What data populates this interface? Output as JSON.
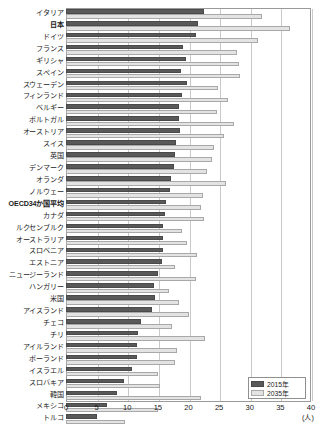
{
  "chart_data": {
    "type": "bar",
    "orientation": "horizontal",
    "title": "",
    "xlabel": "(人)",
    "ylabel": "",
    "xlim": [
      0,
      40
    ],
    "xticks": [
      0,
      5,
      10,
      15,
      20,
      25,
      30,
      35,
      40
    ],
    "xtick_labels": [
      "0",
      "5",
      "10",
      "15",
      "20",
      "25",
      "30",
      "35",
      "40"
    ],
    "grid": true,
    "legend_position": "bottom-right",
    "legend": [
      "2015年",
      "2035年"
    ],
    "categories": [
      "イタリア",
      "日本",
      "ドイツ",
      "フランス",
      "ギリシャ",
      "スペイン",
      "スウェーデン",
      "フィンランド",
      "ベルギー",
      "ポルトガル",
      "オーストリア",
      "スイス",
      "英国",
      "デンマーク",
      "オランダ",
      "ノルウェー",
      "OECD34か国平均",
      "カナダ",
      "ルクセンブルク",
      "オーストラリア",
      "スロベニア",
      "エストニア",
      "ニュージーランド",
      "ハンガリー",
      "米国",
      "アイスランド",
      "チェコ",
      "チリ",
      "アイルランド",
      "ポーランド",
      "イスラエル",
      "スロバキア",
      "韓国",
      "メキシコ",
      "トルコ"
    ],
    "bold_categories": [
      "日本",
      "OECD34か国平均"
    ],
    "series": [
      {
        "name": "2015年",
        "color": "#595959",
        "values": [
          22.6,
          21.6,
          21.2,
          19.1,
          19.6,
          18.8,
          19.7,
          19.0,
          18.5,
          18.5,
          18.6,
          17.9,
          17.8,
          17.6,
          17.2,
          16.9,
          16.3,
          16.1,
          15.9,
          15.9,
          15.8,
          15.6,
          15.1,
          14.4,
          14.5,
          14.1,
          12.3,
          11.8,
          11.6,
          11.6,
          10.7,
          9.4,
          8.3,
          6.7,
          5.0
        ]
      },
      {
        "name": "2035年",
        "color": "#e3e3e3",
        "values": [
          32.0,
          36.6,
          31.3,
          27.9,
          28.2,
          28.4,
          24.8,
          26.4,
          24.6,
          27.4,
          25.8,
          24.1,
          23.8,
          23.0,
          26.1,
          22.4,
          22.1,
          22.6,
          18.9,
          19.7,
          21.4,
          17.8,
          21.3,
          16.8,
          18.4,
          20.0,
          17.3,
          22.7,
          18.2,
          17.8,
          15.1,
          15.4,
          22.1,
          15.0,
          9.6
        ]
      }
    ]
  }
}
